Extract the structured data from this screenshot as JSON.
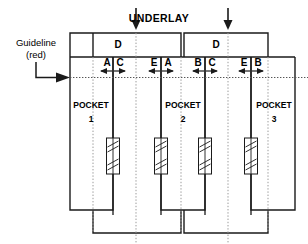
{
  "diagram": {
    "colors": {
      "ink": "#1a1a1a",
      "guide_dotted": "#9a9a9a",
      "background": "#ffffff"
    },
    "annotations": {
      "underlay_label": "UNDERLAY",
      "guideline_label_line1": "Guideline",
      "guideline_label_line2": "(red)"
    },
    "underlay_panels": [
      {
        "name": "underlay-panel-left",
        "label": "D"
      },
      {
        "name": "underlay-panel-right",
        "label": "D"
      }
    ],
    "underlay_arrows": [
      {
        "name": "underlay-arrow-left"
      },
      {
        "name": "underlay-arrow-right"
      }
    ],
    "dimension_pairs": [
      {
        "name": "dim-pair-1",
        "left_label": "A",
        "right_label": "C"
      },
      {
        "name": "dim-pair-2",
        "left_label": "E",
        "right_label": "A"
      },
      {
        "name": "dim-pair-3",
        "left_label": "B",
        "right_label": "C"
      },
      {
        "name": "dim-pair-4",
        "left_label": "E",
        "right_label": "B"
      }
    ],
    "pockets": [
      {
        "name": "pocket-1",
        "label": "POCKET",
        "number": "1"
      },
      {
        "name": "pocket-2",
        "label": "POCKET",
        "number": "2"
      },
      {
        "name": "pocket-3",
        "label": "POCKET",
        "number": "3"
      }
    ],
    "fasteners": [
      {
        "name": "fastener-slot-1"
      },
      {
        "name": "fastener-slot-2"
      },
      {
        "name": "fastener-slot-3"
      },
      {
        "name": "fastener-slot-4"
      }
    ]
  }
}
